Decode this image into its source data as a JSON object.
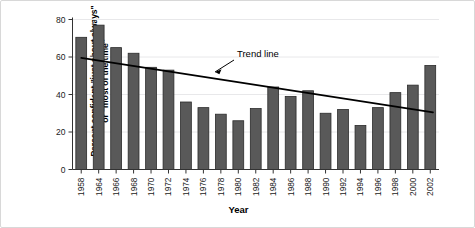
{
  "figure": {
    "ylabel_line1": "Percent confident \"just about always\"",
    "ylabel_line2": "or \"most of the time\"",
    "ylabel_full": "Percent confident \"just about always\"\nor \"most of the time\"",
    "xlabel": "Year",
    "annotation": "Trend line",
    "bar_color": "#595959",
    "bar_edge_color": "#2b2b2b",
    "trend_color": "#000000",
    "axis_color": "#333333",
    "grid_color": "#e8e8ea",
    "frame_color": "#d8d8d8",
    "background": "#ffffff"
  },
  "chart_data": {
    "type": "bar",
    "title": "",
    "xlabel": "Year",
    "ylabel": "Percent confident \"just about always\" or \"most of the time\"",
    "categories": [
      "1958",
      "1964",
      "1966",
      "1968",
      "1970",
      "1972",
      "1974",
      "1976",
      "1978",
      "1980",
      "1982",
      "1984",
      "1986",
      "1988",
      "1990",
      "1992",
      "1994",
      "1996",
      "1998",
      "2000",
      "2002"
    ],
    "values": [
      70.5,
      77,
      65,
      62,
      54.5,
      53,
      36,
      33,
      29.5,
      26,
      32.5,
      44,
      39,
      42,
      30,
      32,
      23.5,
      33,
      41,
      45,
      55.5
    ],
    "ylim": [
      0,
      80
    ],
    "yticks": [
      0,
      20,
      40,
      60,
      80
    ],
    "ytick_labels": [
      "0",
      "20",
      "40",
      "60",
      "80"
    ],
    "grid": "horizontal-faint",
    "legend": "none",
    "annotations": [
      {
        "text": "Trend line",
        "points_to": "trend-line",
        "arrow": true
      }
    ],
    "series": [
      {
        "name": "Percent confident",
        "type": "bar",
        "values": [
          70.5,
          77,
          65,
          62,
          54.5,
          53,
          36,
          33,
          29.5,
          26,
          32.5,
          44,
          39,
          42,
          30,
          32,
          23.5,
          33,
          41,
          45,
          55.5
        ]
      },
      {
        "name": "Trend line",
        "type": "line",
        "x": [
          "1958",
          "2002"
        ],
        "values": [
          59.5,
          30.5
        ]
      }
    ]
  }
}
